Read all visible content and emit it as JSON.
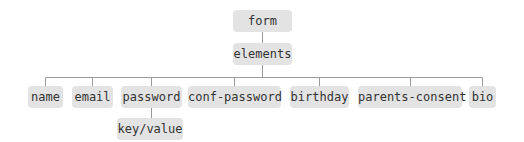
{
  "diagram": {
    "type": "tree",
    "colors": {
      "node_bg": "#e3e3e3",
      "text": "#333333",
      "line": "#9a9a9a"
    },
    "root": {
      "label": "form"
    },
    "level1": {
      "label": "elements"
    },
    "children": [
      {
        "label": "name"
      },
      {
        "label": "email"
      },
      {
        "label": "password",
        "child": {
          "label": "key/value"
        }
      },
      {
        "label": "conf-password"
      },
      {
        "label": "birthday"
      },
      {
        "label": "parents-consent"
      },
      {
        "label": "bio"
      }
    ]
  }
}
